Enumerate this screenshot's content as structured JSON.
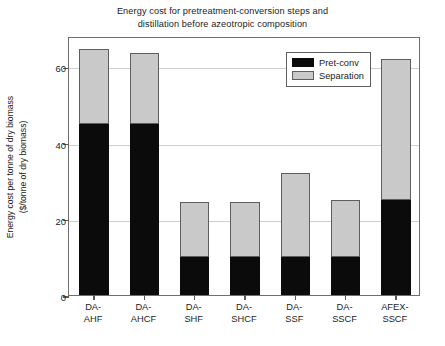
{
  "chart_data": {
    "type": "bar",
    "subtype": "stacked-vertical",
    "title": "Energy cost for pretreatment-conversion steps and distillation before azeotropic composition",
    "title_lines": [
      "Energy cost for pretreatment-conversion steps and",
      "distillation before azeotropic composition"
    ],
    "xlabel": "",
    "ylabel": "Energy cost per tonne of dry biomass ($/tonne of dry biomass)",
    "ylabel_lines": [
      "Energy cost per tonne of dry biomass",
      "($/tonne of dry biomass)"
    ],
    "categories": [
      "DA-AHF",
      "DA-AHCF",
      "DA-SHF",
      "DA-SHCF",
      "DA-SSF",
      "DA-SSCF",
      "AFEX-SSCF"
    ],
    "category_lines": [
      [
        "DA-",
        "AHF"
      ],
      [
        "DA-",
        "AHCF"
      ],
      [
        "DA-",
        "SHF"
      ],
      [
        "DA-",
        "SHCF"
      ],
      [
        "DA-",
        "SSF"
      ],
      [
        "DA-",
        "SSCF"
      ],
      [
        "AFEX-",
        "SSCF"
      ]
    ],
    "series": [
      {
        "name": "Pret-conv",
        "color": "#0b0b0b",
        "values": [
          45,
          45,
          10,
          10,
          10,
          10,
          25
        ]
      },
      {
        "name": "Separation",
        "color": "#c9c9c9",
        "values": [
          19.5,
          18.5,
          14.5,
          14.5,
          22,
          15,
          37
        ]
      }
    ],
    "totals": [
      64.5,
      63.5,
      24.5,
      24.5,
      32,
      25,
      62
    ],
    "ylim": [
      0,
      68
    ],
    "yticks": [
      0,
      20,
      40,
      60
    ],
    "ytick_labels": [
      "0",
      "20",
      "40",
      "60"
    ],
    "grid": "horizontal",
    "legend_position": "top-right-inside",
    "legend_entries": [
      "Pret-conv",
      "Separation"
    ]
  },
  "legend": {
    "items": [
      {
        "label": "Pret-conv",
        "swatch": "black-swatch-icon"
      },
      {
        "label": "Separation",
        "swatch": "gray-swatch-icon"
      }
    ]
  }
}
